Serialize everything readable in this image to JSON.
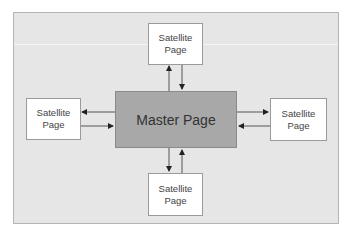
{
  "diagram": {
    "master": {
      "label": "Master Page",
      "color": "#a8a8a8"
    },
    "satellites": {
      "top": {
        "line1": "Satellite",
        "line2": "Page"
      },
      "left": {
        "line1": "Satellite",
        "line2": "Page"
      },
      "right": {
        "line1": "Satellite",
        "line2": "Page"
      },
      "bottom": {
        "line1": "Satellite",
        "line2": "Page"
      }
    },
    "connections": [
      {
        "between": [
          "master",
          "top"
        ],
        "direction": "bidirectional"
      },
      {
        "between": [
          "master",
          "left"
        ],
        "direction": "bidirectional"
      },
      {
        "between": [
          "master",
          "right"
        ],
        "direction": "bidirectional"
      },
      {
        "between": [
          "master",
          "bottom"
        ],
        "direction": "bidirectional"
      }
    ],
    "background_color": "#e6e6e6"
  }
}
